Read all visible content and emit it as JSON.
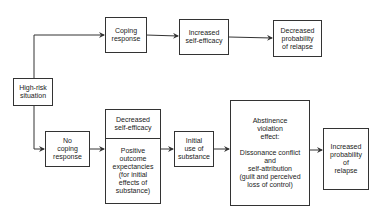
{
  "diagram": {
    "type": "flowchart",
    "title": "",
    "nodes": {
      "high_risk": "High-risk\nsituation",
      "coping": "Coping\nresponse",
      "inc_self_efficacy": "Increased\nself-efficacy",
      "dec_prob_relapse": "Decreased\nprobability\nof relapse",
      "no_coping": "No\ncoping\nresponse",
      "dec_self_efficacy": "Decreased\nself-efficacy",
      "positive_outcome": "Positive\noutcome\nexpectancies\n(for initial\neffects of\nsubstance)",
      "initial_use": "Initial\nuse of\nsubstance",
      "ave_title": "Abstinence\nviolation\neffect:",
      "ave_detail": "Dissonance conflict\nand\nself-attribution\n(guilt and perceived\nloss of control)",
      "inc_prob_relapse": "Increased\nprobability\nof\nrelapse"
    },
    "edges": [
      {
        "from": "high_risk",
        "to": "coping"
      },
      {
        "from": "coping",
        "to": "inc_self_efficacy"
      },
      {
        "from": "inc_self_efficacy",
        "to": "dec_prob_relapse"
      },
      {
        "from": "high_risk",
        "to": "no_coping"
      },
      {
        "from": "no_coping",
        "to": "dec_self_efficacy_positive_outcome"
      },
      {
        "from": "dec_self_efficacy_positive_outcome",
        "to": "initial_use"
      },
      {
        "from": "initial_use",
        "to": "abstinence_violation_effect"
      },
      {
        "from": "abstinence_violation_effect",
        "to": "inc_prob_relapse"
      }
    ],
    "colors": {
      "line": "#333333",
      "background": "#ffffff",
      "text": "#222222"
    }
  }
}
